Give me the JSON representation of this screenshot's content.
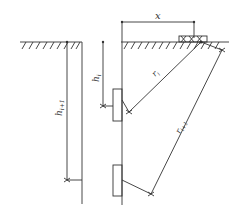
{
  "diagram": {
    "type": "borehole-seismic-geometry",
    "labels": {
      "x": "x",
      "h_i": "h",
      "h_i_sub": "i",
      "h_i1": "h",
      "h_i1_sub": "i+1",
      "r_i": "r",
      "r_i_sub": "i",
      "r_i1": "r",
      "r_i1_sub": "i+1"
    },
    "elements": [
      "ground-surface-left",
      "ground-surface-right",
      "borehole-left",
      "borehole-right",
      "source-device",
      "receiver-upper",
      "receiver-lower",
      "ray-r-i",
      "ray-r-i-plus-1",
      "dimension-x",
      "dimension-h-i",
      "dimension-h-i-plus-1"
    ],
    "colors": {
      "line": "#333333",
      "background": "#ffffff"
    }
  }
}
